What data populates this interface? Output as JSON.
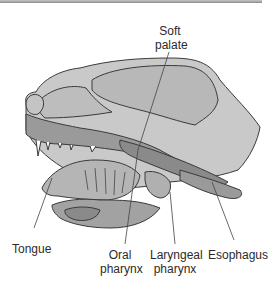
{
  "figure": {
    "labels": {
      "soft_palate": [
        "Soft",
        "palate"
      ],
      "tongue": "Tongue",
      "oral_pharynx": [
        "Oral",
        "pharynx"
      ],
      "laryngeal_pharynx": [
        "Laryngeal",
        "pharynx"
      ],
      "esophagus": "Esophagus"
    }
  },
  "colors": {
    "light_tissue": "#c9c9c9",
    "mid_tissue": "#a9a9a9",
    "dark_tissue": "#8a8a8a",
    "outline": "#3a3a3a",
    "leader_line": "#444444",
    "rule": "#9a9a9a"
  }
}
